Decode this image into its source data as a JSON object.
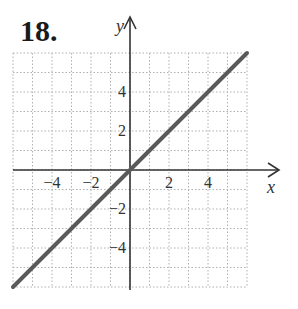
{
  "problem": {
    "number": "18."
  },
  "chart_data": {
    "type": "line",
    "title": "",
    "xlabel": "x",
    "ylabel": "y",
    "xlim": [
      -6,
      6
    ],
    "ylim": [
      -6,
      6
    ],
    "grid": true,
    "grid_style": "dotted",
    "x_ticks": [
      -4,
      -2,
      2,
      4
    ],
    "y_ticks": [
      4,
      2,
      -2,
      -4
    ],
    "x_tick_labels": [
      "−4",
      "−2",
      "2",
      "4"
    ],
    "y_tick_labels": [
      "4",
      "2",
      "−2",
      "−4"
    ],
    "series": [
      {
        "name": "y = x",
        "x": [
          -6,
          6
        ],
        "y": [
          -6,
          6
        ],
        "color": "#5a5a5a"
      }
    ]
  },
  "colors": {
    "axis": "#333333",
    "grid": "#b0b0b0",
    "line": "#5a5a5a"
  }
}
